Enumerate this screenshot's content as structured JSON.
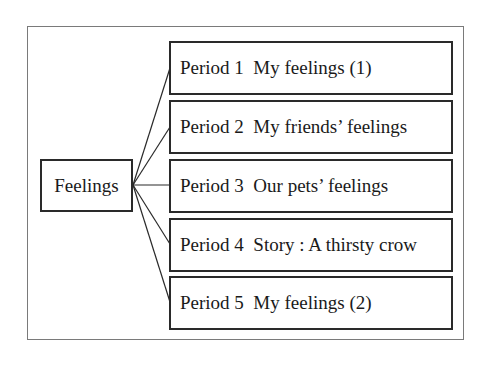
{
  "diagram": {
    "type": "tree",
    "root": {
      "label": "Feelings"
    },
    "children": [
      {
        "period": "Period 1",
        "title": "My feelings (1)",
        "label": "Period 1  My feelings (1)"
      },
      {
        "period": "Period 2",
        "title": "My friends’ feelings",
        "label": "Period 2  My friends’ feelings"
      },
      {
        "period": "Period 3",
        "title": "Our pets’ feelings",
        "label": "Period 3  Our pets’ feelings"
      },
      {
        "period": "Period 4",
        "title": "Story: A thirsty crow",
        "label": "Period 4  Story : A thirsty crow"
      },
      {
        "period": "Period 5",
        "title": "My feelings (2)",
        "label": "Period 5  My feelings (2)"
      }
    ],
    "colors": {
      "line": "#2a2a2a",
      "frame": "#7a7a7a",
      "background": "#ffffff"
    }
  }
}
